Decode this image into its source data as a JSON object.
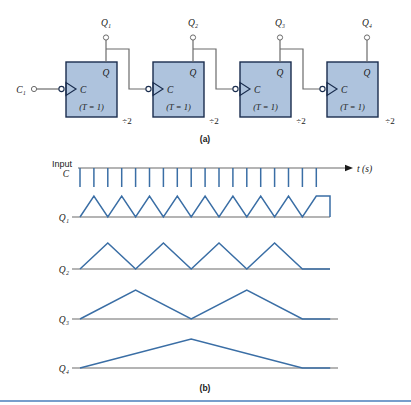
{
  "figure": {
    "panel_a_caption": "(a)",
    "panel_b_caption": "(b)",
    "colors": {
      "box_fill": "#aec3dd",
      "box_stroke": "#1a2d4e",
      "wire": "#6b6b6b",
      "waveform": "#3a6ea5",
      "baseline": "#6b6b6b",
      "rule": "#4a7ebb",
      "text": "#1a1a1a"
    }
  },
  "circuit": {
    "input_label": "C₁",
    "flipflops": [
      {
        "q_out_label": "Q₁",
        "q_pin_label": "Q",
        "c_pin_label": "C",
        "mode_label": "(T = 1)",
        "divider_label": "÷2"
      },
      {
        "q_out_label": "Q₂",
        "q_pin_label": "Q",
        "c_pin_label": "C",
        "mode_label": "(T = 1)",
        "divider_label": "÷2"
      },
      {
        "q_out_label": "Q₃",
        "q_pin_label": "Q",
        "c_pin_label": "C",
        "mode_label": "(T = 1)",
        "divider_label": "÷2"
      },
      {
        "q_out_label": "Q₄",
        "q_pin_label": "Q",
        "c_pin_label": "C",
        "mode_label": "(T = 1)",
        "divider_label": "÷2"
      }
    ]
  },
  "timing": {
    "axis_label": "t (s)",
    "input_label_line1": "Input",
    "input_label_line2": "C",
    "rows": [
      {
        "name": "clock",
        "label": ""
      },
      {
        "name": "q1",
        "label": "Q₁"
      },
      {
        "name": "q2",
        "label": "Q₂"
      },
      {
        "name": "q3",
        "label": "Q₃"
      },
      {
        "name": "q4",
        "label": "Q₄"
      }
    ]
  },
  "chart_data": {
    "type": "line",
    "xlabel": "t (s)",
    "ylabel": "",
    "grid": false,
    "legend": "none",
    "x_start": 80,
    "x_end": 330,
    "tick_count": 18,
    "tick_spacing": 13.9,
    "series": [
      {
        "name": "Input C",
        "description": "Clock: high baseline with 18 narrow downward pulses",
        "type": "pulse-down",
        "pulse_count": 18,
        "values": [
          1,
          0,
          1,
          0,
          1,
          0,
          1,
          0,
          1,
          0,
          1,
          0,
          1,
          0,
          1,
          0,
          1,
          0,
          1,
          0,
          1,
          0,
          1,
          0,
          1,
          0,
          1,
          0,
          1,
          0,
          1,
          0,
          1,
          0,
          1,
          0
        ]
      },
      {
        "name": "Q₁",
        "description": "Divide by 2 of clock; 9 full high pulses",
        "type": "square",
        "period_ticks": 2,
        "pulse_count": 9,
        "values": [
          0,
          1,
          0,
          1,
          0,
          1,
          0,
          1,
          0,
          1,
          0,
          1,
          0,
          1,
          0,
          1,
          0,
          1
        ]
      },
      {
        "name": "Q₂",
        "description": "Divide by 4 of clock; 4 full high pulses plus partial",
        "type": "square",
        "period_ticks": 4,
        "pulse_count": 4,
        "values": [
          0,
          0,
          1,
          1,
          0,
          0,
          1,
          1,
          0,
          0,
          1,
          1,
          0,
          0,
          1,
          1,
          0,
          0
        ]
      },
      {
        "name": "Q₃",
        "description": "Divide by 8 of clock; 2 high pulses",
        "type": "square",
        "period_ticks": 8,
        "pulse_count": 2,
        "values": [
          0,
          0,
          0,
          0,
          1,
          1,
          1,
          1,
          0,
          0,
          0,
          0,
          1,
          1,
          1,
          1,
          0,
          0
        ]
      },
      {
        "name": "Q₄",
        "description": "Divide by 16 of clock; 1 high pulse",
        "type": "square",
        "period_ticks": 16,
        "pulse_count": 1,
        "values": [
          0,
          0,
          0,
          0,
          0,
          0,
          0,
          0,
          1,
          1,
          1,
          1,
          1,
          1,
          1,
          1,
          0,
          0
        ]
      }
    ]
  }
}
